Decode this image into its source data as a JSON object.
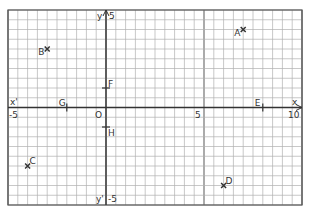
{
  "diagram": {
    "type": "coordinate-grid",
    "x_axis": {
      "label_positive": "x",
      "label_negative": "x'",
      "min": -5,
      "max": 10,
      "tick_labels": [
        "-5",
        "5",
        "10"
      ]
    },
    "y_axis": {
      "label_positive": "y",
      "label_negative": "y'",
      "min": -5,
      "max": 5,
      "tick_labels": [
        "5",
        "-5"
      ]
    },
    "origin_label": "O",
    "minor_step": 0.5,
    "colors": {
      "grid": "#b0b0b0",
      "axis": "#333333",
      "border": "#555555",
      "point": "#333333"
    }
  },
  "points": [
    {
      "label": "A",
      "x": 7,
      "y": 4,
      "marker": "cross"
    },
    {
      "label": "B",
      "x": -3,
      "y": 3,
      "marker": "cross"
    },
    {
      "label": "C",
      "x": -4,
      "y": -3,
      "marker": "cross"
    },
    {
      "label": "D",
      "x": 6,
      "y": -4,
      "marker": "cross"
    },
    {
      "label": "E",
      "x": 8,
      "y": 0,
      "marker": "tick"
    },
    {
      "label": "F",
      "x": 0,
      "y": 1,
      "marker": "tick"
    },
    {
      "label": "G",
      "x": -2,
      "y": 0,
      "marker": "tick"
    },
    {
      "label": "H",
      "x": 0,
      "y": -1,
      "marker": "tick"
    }
  ]
}
